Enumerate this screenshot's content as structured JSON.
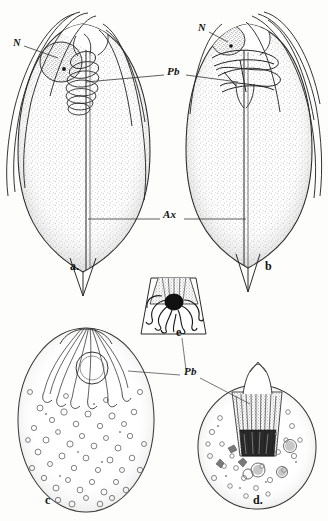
{
  "figure": {
    "type": "scientific-line-drawing",
    "style": "monochrome stipple and line engraving",
    "ink_color": "#1a1a1a",
    "stipple_color": "#6e6e6e",
    "background_color": "#fdfdfb",
    "width": 328,
    "height": 521
  },
  "anatomical_labels": [
    {
      "key": "n_a",
      "text": "N",
      "panel": "a",
      "meaning": "nucleus",
      "x": 13,
      "y": 44
    },
    {
      "key": "n_b",
      "text": "N",
      "panel": "b",
      "meaning": "nucleus",
      "x": 198,
      "y": 29
    },
    {
      "key": "pb_top",
      "text": "Pb",
      "panel": "a-b",
      "meaning": "polar body",
      "x": 167,
      "y": 72
    },
    {
      "key": "ax",
      "text": "Ax",
      "panel": "a-b",
      "meaning": "axial filament",
      "x": 163,
      "y": 215
    },
    {
      "key": "pb_bot",
      "text": "Pb",
      "panel": "c-d-e",
      "meaning": "polar body",
      "x": 184,
      "y": 372
    }
  ],
  "panel_letters": [
    {
      "key": "a",
      "text": "a.",
      "x": 70,
      "y": 266
    },
    {
      "key": "b",
      "text": "b",
      "x": 265,
      "y": 266
    },
    {
      "key": "e",
      "text": "e",
      "x": 176,
      "y": 332
    },
    {
      "key": "c",
      "text": "c",
      "x": 45,
      "y": 500
    },
    {
      "key": "d",
      "text": "d.",
      "x": 253,
      "y": 500
    }
  ],
  "panels": [
    {
      "key": "a",
      "description": "Whole spindle-shaped spore, lateral view, with emerging flagellar filaments, nucleus and coiled polar filament"
    },
    {
      "key": "b",
      "description": "Whole spindle-shaped spore, opposite view, coiled polar filament visible"
    },
    {
      "key": "c",
      "description": "Large ovoid sporoplasm with open vesicular granules and apical filament bundle"
    },
    {
      "key": "d",
      "description": "Rounded sporoplasm with dense stippling and dark striated polar capsule"
    },
    {
      "key": "e",
      "description": "Trapezoidal apical section showing dark nucleus and wavy extruded filaments"
    }
  ]
}
